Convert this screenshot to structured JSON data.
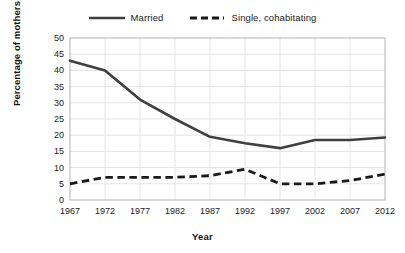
{
  "chart_data": {
    "type": "line",
    "title": "",
    "xlabel": "Year",
    "ylabel": "Percentage of mothers",
    "xlim": [
      1967,
      2012
    ],
    "ylim": [
      0,
      50
    ],
    "ytick_step": 5,
    "xtick_step": 5,
    "grid": true,
    "legend_position": "top",
    "yticks": [
      "50",
      "45",
      "40",
      "35",
      "30",
      "25",
      "20",
      "15",
      "10",
      "5",
      "0"
    ],
    "xticks": [
      "1967",
      "1972",
      "1977",
      "1982",
      "1987",
      "1992",
      "1997",
      "2002",
      "2007",
      "2012"
    ],
    "x": [
      1967,
      1972,
      1977,
      1982,
      1987,
      1992,
      1997,
      2002,
      2007,
      2012
    ],
    "series": [
      {
        "name": "Married",
        "style": "solid",
        "color": "#3f3f3f",
        "values": [
          43,
          40,
          31,
          25,
          19.5,
          17.5,
          16,
          18.5,
          18.5,
          19.3
        ]
      },
      {
        "name": "Single, cohabitating",
        "style": "dashed",
        "color": "#1a1a1a",
        "values": [
          5,
          7,
          7,
          7,
          7.5,
          9.5,
          5,
          5,
          6,
          8
        ]
      }
    ]
  },
  "legend": {
    "entries": [
      {
        "label": "Married"
      },
      {
        "label": "Single, cohabitating"
      }
    ]
  },
  "colors": {
    "background": "#ffffff",
    "plot_border": "#bfbfbf",
    "grid": "#e4e4e4",
    "text": "#1c1c1c",
    "married_line": "#3f3f3f",
    "single_line": "#1a1a1a"
  }
}
